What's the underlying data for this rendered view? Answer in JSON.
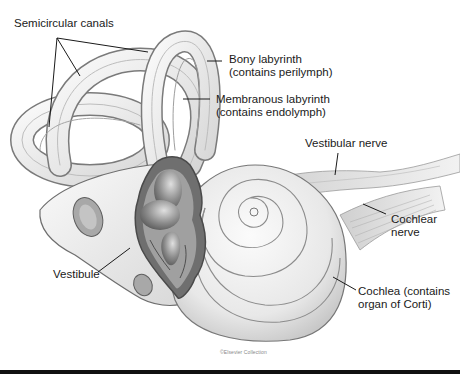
{
  "figure": {
    "labels": {
      "semicircular_canals": "Semicircular canals",
      "bony_labyrinth_line1": "Bony labyrinth",
      "bony_labyrinth_line2": "(contains perilymph)",
      "membranous_labyrinth_line1": "Membranous labyrinth",
      "membranous_labyrinth_line2": "(contains endolymph)",
      "vestibular_nerve": "Vestibular nerve",
      "cochlear_nerve_line1": "Cochlear",
      "cochlear_nerve_line2": "nerve",
      "vestibule": "Vestibule",
      "cochlea_line1": "Cochlea (contains",
      "cochlea_line2": "organ of Corti)"
    },
    "credit": "©Elsevier Collection",
    "colors": {
      "background": "#ffffff",
      "structure_fill": "#ececec",
      "structure_stroke": "#6e6e6e",
      "interior_dark": "#8a8a8a",
      "leader_line": "#1a1a1a",
      "bottom_rule": "#111111"
    }
  }
}
